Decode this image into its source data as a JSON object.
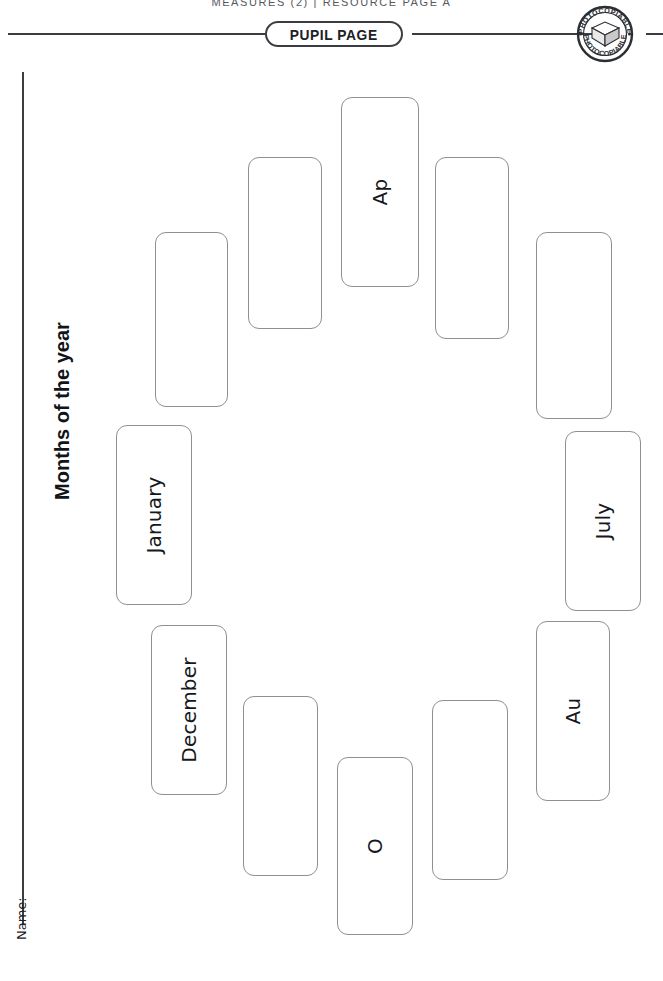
{
  "header": {
    "caption": "MEASURES (2)  |  RESOURCE PAGE A",
    "pill_label": "PUPIL PAGE",
    "stamp_text_top": "PHOTOCOPIABLE",
    "stamp_text_bottom": "PHOTOCOPIABLE"
  },
  "sheet": {
    "title": "Months of the year",
    "name_label": "Name:"
  },
  "colors": {
    "rule": "#3a3d42",
    "box_border": "#8d9095",
    "text": "#15181c",
    "caption": "#55585c",
    "page_bg": "#ffffff"
  },
  "boxes": [
    {
      "id": "box-1",
      "label": "",
      "x": 341,
      "y": 97,
      "w": 78,
      "h": 190
    },
    {
      "id": "box-2",
      "label": "Ap",
      "x": 341,
      "y": 97,
      "w": 78,
      "h": 190
    },
    {
      "id": "box-3",
      "label": "",
      "x": 435,
      "y": 157,
      "w": 74,
      "h": 182
    },
    {
      "id": "box-4",
      "label": "",
      "x": 536,
      "y": 232,
      "w": 76,
      "h": 187
    },
    {
      "id": "box-5",
      "label": "July",
      "x": 565,
      "y": 431,
      "w": 76,
      "h": 180
    },
    {
      "id": "box-6",
      "label": "Au",
      "x": 536,
      "y": 621,
      "w": 74,
      "h": 180
    },
    {
      "id": "box-7",
      "label": "",
      "x": 432,
      "y": 700,
      "w": 76,
      "h": 180
    },
    {
      "id": "box-8",
      "label": "O",
      "x": 337,
      "y": 757,
      "w": 76,
      "h": 178
    },
    {
      "id": "box-9",
      "label": "",
      "x": 243,
      "y": 696,
      "w": 75,
      "h": 180
    },
    {
      "id": "box-10",
      "label": "December",
      "x": 151,
      "y": 625,
      "w": 76,
      "h": 170
    },
    {
      "id": "box-11",
      "label": "January",
      "x": 116,
      "y": 425,
      "w": 76,
      "h": 180
    },
    {
      "id": "box-12",
      "label": "",
      "x": 155,
      "y": 232,
      "w": 73,
      "h": 175
    },
    {
      "id": "box-13",
      "label": "",
      "x": 248,
      "y": 157,
      "w": 74,
      "h": 172
    }
  ],
  "box_order": [
    {
      "key": "top",
      "label": "Ap",
      "x": 341,
      "y": 97,
      "w": 78,
      "h": 190
    },
    {
      "key": "upper-right",
      "label": "",
      "x": 435,
      "y": 157,
      "w": 74,
      "h": 182
    },
    {
      "key": "right-upper",
      "label": "",
      "x": 536,
      "y": 232,
      "w": 76,
      "h": 187
    },
    {
      "key": "right-mid",
      "label": "July",
      "x": 565,
      "y": 431,
      "w": 76,
      "h": 180
    },
    {
      "key": "right-lower",
      "label": "Au",
      "x": 536,
      "y": 621,
      "w": 74,
      "h": 180
    },
    {
      "key": "lower-right",
      "label": "",
      "x": 432,
      "y": 700,
      "w": 76,
      "h": 180
    },
    {
      "key": "bottom",
      "label": "O",
      "x": 337,
      "y": 757,
      "w": 76,
      "h": 178
    },
    {
      "key": "lower-left",
      "label": "",
      "x": 243,
      "y": 696,
      "w": 75,
      "h": 180
    },
    {
      "key": "left-lower",
      "label": "December",
      "x": 151,
      "y": 625,
      "w": 76,
      "h": 170
    },
    {
      "key": "left-mid",
      "label": "January",
      "x": 116,
      "y": 425,
      "w": 76,
      "h": 180
    },
    {
      "key": "left-upper",
      "label": "",
      "x": 155,
      "y": 232,
      "w": 73,
      "h": 175
    },
    {
      "key": "upper-left",
      "label": "",
      "x": 248,
      "y": 157,
      "w": 74,
      "h": 172
    }
  ]
}
